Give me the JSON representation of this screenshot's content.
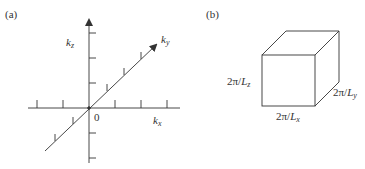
{
  "panel_a": {
    "label": "(a)",
    "origin_label": "0",
    "axes": {
      "kz": {
        "base": "k",
        "sub": "z"
      },
      "ky": {
        "base": "k",
        "sub": "y"
      },
      "kx": {
        "base": "k",
        "sub": "x"
      }
    }
  },
  "panel_b": {
    "label": "(b)",
    "edge_z": {
      "prefix": "2π/",
      "base": "L",
      "sub": "z"
    },
    "edge_y": {
      "prefix": "2π/",
      "base": "L",
      "sub": "y"
    },
    "edge_x": {
      "prefix": "2π/",
      "base": "L",
      "sub": "x"
    }
  },
  "colors": {
    "stroke": "#333333",
    "text": "#333333"
  }
}
